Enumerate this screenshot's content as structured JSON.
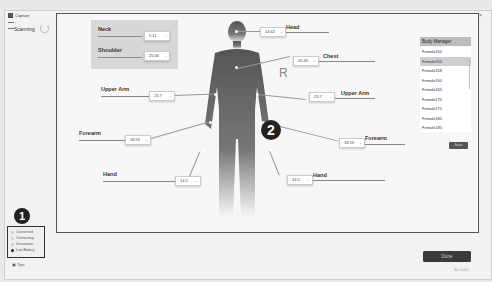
{
  "window": {
    "title": "Capture",
    "controls": [
      "–",
      "□",
      "×"
    ]
  },
  "status_left": {
    "scanning_label": "Scanning"
  },
  "measurements": {
    "neck": {
      "label": "Neck",
      "value": "5.11"
    },
    "shoulder": {
      "label": "Shoulder",
      "value": "25.46"
    },
    "head": {
      "label": "Head",
      "value": "14.62"
    },
    "chest": {
      "label": "Chest",
      "value": "45.49"
    },
    "upper_arm_left": {
      "label": "Upper Arm",
      "value": "23.7"
    },
    "upper_arm_right": {
      "label": "Upper Arm",
      "value": "23.7"
    },
    "forearm_left": {
      "label": "Forearm",
      "value": "18.59"
    },
    "forearm_right": {
      "label": "Forearm",
      "value": "18.59"
    },
    "hand_left": {
      "label": "Hand",
      "value": "14.5"
    },
    "hand_right": {
      "label": "Hand",
      "value": "14.5"
    }
  },
  "figure": {
    "left_label": "L",
    "right_label": "R",
    "badge": "2"
  },
  "body_manager": {
    "title": "Body Manager",
    "items": [
      "Female150",
      "Female155",
      "Female158",
      "Female160",
      "Female165",
      "Female170",
      "Female175",
      "Female180",
      "Female185"
    ],
    "selected_index": 1,
    "save_label": "Save"
  },
  "device_status": {
    "badge": "1",
    "items": [
      {
        "label": "Connected",
        "color": "#cccccc"
      },
      {
        "label": "Connecting",
        "color": "#cccccc"
      },
      {
        "label": "Disconnect",
        "color": "#cccccc"
      },
      {
        "label": "Low Battery",
        "color": "#222222"
      }
    ]
  },
  "tips_label": "Tips",
  "done_label": "Done",
  "version_label": "Ver 1.0.0.0"
}
